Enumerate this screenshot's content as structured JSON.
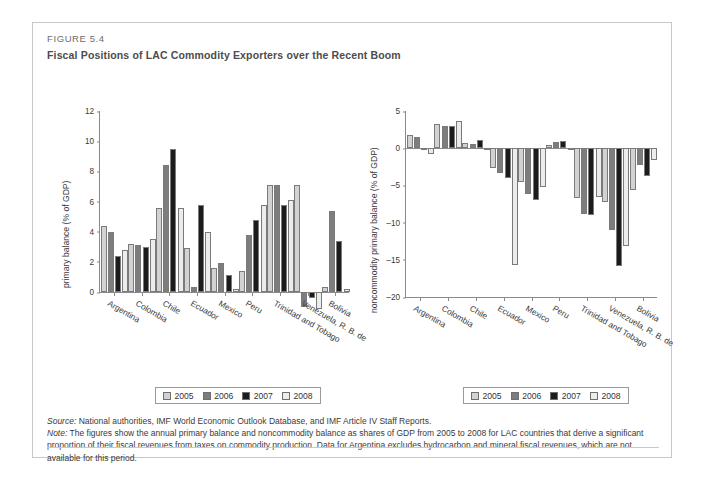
{
  "figure": {
    "label": "FIGURE 5.4",
    "title": "Fiscal Positions of LAC Commodity Exporters over the Recent Boom"
  },
  "legend": {
    "items": [
      {
        "label": "2005",
        "color": "#d2d2d2"
      },
      {
        "label": "2006",
        "color": "#7d7d7d"
      },
      {
        "label": "2007",
        "color": "#1c1c1c"
      },
      {
        "label": "2008",
        "color": "#ececec"
      }
    ]
  },
  "notes": {
    "source_label": "Source:",
    "source_text": " National authorities, IMF World Economic Outlook Database, and IMF Article IV Staff Reports.",
    "note_label": "Note:",
    "note_text": " The figures show the annual primary balance and noncommodity balance as shares of GDP from 2005 to 2008 for LAC countries that derive a significant proportion of their fiscal revenues from taxes on commodity production. Data for Argentina excludes hydrocarbon and mineral fiscal revenues, which are not available for this period."
  },
  "chart_data": [
    {
      "type": "bar",
      "id": "primary-balance",
      "title": "",
      "xlabel": "",
      "ylabel": "primary balance (% of GDP)",
      "ylim": [
        0,
        12
      ],
      "yticks": [
        0,
        2,
        4,
        6,
        8,
        10,
        12
      ],
      "grid": false,
      "legend_position": "below",
      "categories": [
        "Argentina",
        "Colombia",
        "Chile",
        "Ecuador",
        "Mexico",
        "Peru",
        "Trinidad and Tobago",
        "Venezuela, R. B. de",
        "Bolivia"
      ],
      "series": [
        {
          "name": "2005",
          "values": [
            4.4,
            3.2,
            5.6,
            2.9,
            1.6,
            1.4,
            7.1,
            7.1,
            0.3
          ]
        },
        {
          "name": "2006",
          "values": [
            4.0,
            3.1,
            8.4,
            0.3,
            1.9,
            3.8,
            7.1,
            -1.0,
            5.4
          ]
        },
        {
          "name": "2007",
          "values": [
            2.4,
            3.0,
            9.5,
            5.8,
            1.1,
            4.8,
            5.8,
            -0.4,
            3.4
          ]
        },
        {
          "name": "2008",
          "values": [
            2.8,
            3.5,
            5.6,
            4.0,
            0.2,
            5.8,
            6.1,
            -1.1,
            0.2
          ]
        }
      ]
    },
    {
      "type": "bar",
      "id": "noncommodity-primary-balance",
      "title": "",
      "xlabel": "",
      "ylabel": "noncommodity primary balance (% of GDP)",
      "ylim": [
        -20,
        5
      ],
      "yticks": [
        5,
        0,
        -5,
        -10,
        -15,
        -20
      ],
      "grid": false,
      "legend_position": "below",
      "categories": [
        "Argentina",
        "Colombia",
        "Chile",
        "Ecuador",
        "Mexico",
        "Peru",
        "Trinidad and Tobago",
        "Venezuela, R. B. de",
        "Bolivia"
      ],
      "series": [
        {
          "name": "2005",
          "values": [
            1.8,
            3.2,
            0.7,
            -2.6,
            -4.6,
            0.4,
            -6.7,
            -7.3,
            -5.6
          ]
        },
        {
          "name": "2006",
          "values": [
            1.5,
            3.0,
            0.5,
            -3.4,
            -6.2,
            0.9,
            -8.9,
            -11.0,
            -2.3
          ]
        },
        {
          "name": "2007",
          "values": [
            0.0,
            3.0,
            1.1,
            -4.0,
            -6.9,
            1.0,
            -9.0,
            -15.8,
            -3.7
          ]
        },
        {
          "name": "2008",
          "values": [
            -0.8,
            3.7,
            -0.2,
            -15.7,
            -5.2,
            -0.3,
            -6.6,
            -13.2,
            -1.6
          ]
        }
      ]
    }
  ]
}
